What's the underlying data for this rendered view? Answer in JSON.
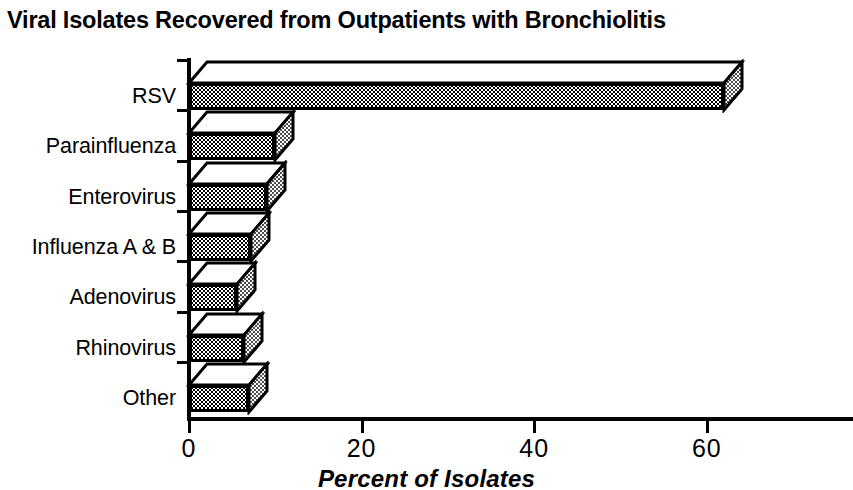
{
  "chart_data": {
    "type": "bar",
    "orientation": "horizontal",
    "title": "Viral Isolates Recovered from Outpatients with Bronchiolitis",
    "xlabel": "Percent of Isolates",
    "ylabel": "",
    "categories": [
      "RSV",
      "Parainfluenza",
      "Enterovirus",
      "Influenza A & B",
      "Adenovirus",
      "Rhinovirus",
      "Other"
    ],
    "values": [
      62,
      10,
      9,
      7.2,
      5.6,
      6.4,
      7
    ],
    "xlim": [
      0,
      77
    ],
    "ylim": [
      0,
      7
    ],
    "xticks": [
      0,
      20,
      40,
      60
    ],
    "xtick_labels": [
      "0",
      "20",
      "40",
      "60"
    ],
    "grid": false,
    "legend": false,
    "style": "3d-extruded-bars",
    "bar_fill": "stipple-dot-pattern",
    "bar_top_fill": "#ffffff",
    "outline_color": "#000000",
    "background": "#ffffff"
  },
  "axis": {
    "x_title": "Percent of Isolates",
    "tick_labels": [
      "0",
      "20",
      "40",
      "60"
    ]
  },
  "categories": [
    {
      "label": "RSV",
      "value": 62
    },
    {
      "label": "Parainfluenza",
      "value": 10
    },
    {
      "label": "Enterovirus",
      "value": 9
    },
    {
      "label": "Influenza A & B",
      "value": 7.2
    },
    {
      "label": "Adenovirus",
      "value": 5.6
    },
    {
      "label": "Rhinovirus",
      "value": 6.4
    },
    {
      "label": "Other",
      "value": 7
    }
  ]
}
